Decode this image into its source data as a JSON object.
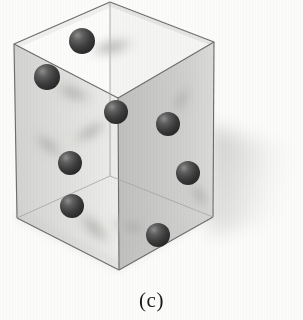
{
  "figure": {
    "caption": "(c)",
    "background_color": "#fbfbfa",
    "canvas": {
      "width": 303,
      "height": 320
    }
  },
  "box": {
    "name": "transparent-rectangular-box",
    "edge_color": "#6f6f6f",
    "left_wall_color": "#dcdcda",
    "right_wall_color": "#c9c9c7",
    "floor_color": "#f2f2f0",
    "back_wall_color": "#f0f0ee",
    "rim_color": "#e6e6e4",
    "vertices": {
      "top_front": [
        118,
        98
      ],
      "top_left": [
        14,
        44
      ],
      "top_back": [
        110,
        2
      ],
      "top_right": [
        214,
        42
      ],
      "bottom_front": [
        119,
        270
      ],
      "bottom_left": [
        17,
        218
      ],
      "bottom_right": [
        213,
        217
      ]
    }
  },
  "spheres": {
    "color": "#3a3a3a",
    "highlight_color": "#7c7c7c",
    "shadow_color": "#b4b4b2",
    "count": 8,
    "items": [
      {
        "id": "sphere-1",
        "cx": 82,
        "cy": 41,
        "r": 13,
        "shadow_dx": 30,
        "shadow_dy": 6,
        "shadow_rx": 26,
        "shadow_ry": 10,
        "shadow_rot": -12
      },
      {
        "id": "sphere-2",
        "cx": 47,
        "cy": 77,
        "r": 13,
        "shadow_dx": 26,
        "shadow_dy": 16,
        "shadow_rx": 24,
        "shadow_ry": 10,
        "shadow_rot": 22
      },
      {
        "id": "sphere-3",
        "cx": 116,
        "cy": 112,
        "r": 12,
        "shadow_dx": -26,
        "shadow_dy": 20,
        "shadow_rx": 24,
        "shadow_ry": 9,
        "shadow_rot": -30
      },
      {
        "id": "sphere-4",
        "cx": 168,
        "cy": 124,
        "r": 12,
        "shadow_dx": 13,
        "shadow_dy": -24,
        "shadow_rx": 22,
        "shadow_ry": 9,
        "shadow_rot": -62
      },
      {
        "id": "sphere-5",
        "cx": 70,
        "cy": 163,
        "r": 12,
        "shadow_dx": -22,
        "shadow_dy": -18,
        "shadow_rx": 23,
        "shadow_ry": 9,
        "shadow_rot": 38
      },
      {
        "id": "sphere-6",
        "cx": 188,
        "cy": 173,
        "r": 12,
        "shadow_dx": 11,
        "shadow_dy": 22,
        "shadow_rx": 21,
        "shadow_ry": 9,
        "shadow_rot": 62
      },
      {
        "id": "sphere-7",
        "cx": 72,
        "cy": 206,
        "r": 12,
        "shadow_dx": 22,
        "shadow_dy": 22,
        "shadow_rx": 26,
        "shadow_ry": 10,
        "shadow_rot": 44
      },
      {
        "id": "sphere-8",
        "cx": 158,
        "cy": 235,
        "r": 12,
        "shadow_dx": -26,
        "shadow_dy": -8,
        "shadow_rx": 25,
        "shadow_ry": 10,
        "shadow_rot": 12
      }
    ]
  },
  "cast_shadow": {
    "name": "box-cast-shadow",
    "color": "#dddddb",
    "points": "213,128 292,155 290,206 213,232"
  }
}
